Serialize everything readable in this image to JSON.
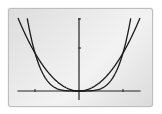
{
  "chart_data": {
    "type": "line",
    "title": "",
    "xlabel": "",
    "ylabel": "",
    "grid": false,
    "legend": "none",
    "x_ticks": [
      -1,
      1
    ],
    "y_ticks": [
      1
    ],
    "xlim": [
      -1.4,
      1.4
    ],
    "ylim": [
      -0.25,
      1.9
    ],
    "series": [
      {
        "name": "y = x^2",
        "function": "x^2",
        "color": "#1a1a1a"
      },
      {
        "name": "y = x^4",
        "function": "x^4",
        "color": "#1a1a1a"
      }
    ],
    "intersections": [
      [
        -1,
        1
      ],
      [
        0,
        0
      ],
      [
        1,
        1
      ]
    ]
  },
  "display": {
    "origin_px": [
      79,
      91
    ],
    "x_scale_px": 44,
    "y_scale_px": 38,
    "axis_color": "#222222",
    "curve_color": "#1a1a1a"
  }
}
